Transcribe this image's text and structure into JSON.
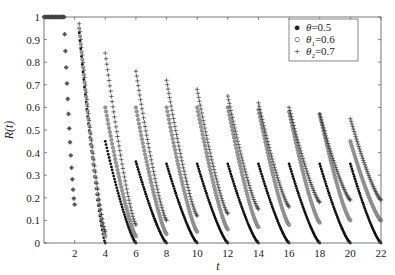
{
  "chart_data": {
    "type": "scatter",
    "title": "",
    "xlabel": "t",
    "ylabel": "R(t)",
    "xlim": [
      0,
      22
    ],
    "ylim": [
      0,
      1
    ],
    "xticks": [
      2,
      4,
      6,
      8,
      10,
      12,
      14,
      16,
      18,
      20,
      22
    ],
    "yticks": [
      0,
      0.1,
      0.2,
      0.3,
      0.4,
      0.5,
      0.6,
      0.7,
      0.8,
      0.9,
      1
    ],
    "grid": false,
    "legend_position": "upper right",
    "series": [
      {
        "name": "θ=0.5",
        "marker": "dot",
        "segments": [
          {
            "t0": 0,
            "t1": 1.3,
            "r0": 1.0,
            "r1": 1.0
          },
          {
            "t0": 1.3,
            "t1": 2.0,
            "r0": 1.0,
            "r1": 0.17
          },
          {
            "t0": 2.3,
            "t1": 4.0,
            "r0": 0.93,
            "r1": 0.0
          },
          {
            "t0": 4.0,
            "t1": 6.0,
            "r0": 0.45,
            "r1": 0.0
          },
          {
            "t0": 6.0,
            "t1": 8.0,
            "r0": 0.36,
            "r1": 0.0
          },
          {
            "t0": 8.0,
            "t1": 10.0,
            "r0": 0.35,
            "r1": 0.0
          },
          {
            "t0": 10.0,
            "t1": 12.0,
            "r0": 0.35,
            "r1": 0.0
          },
          {
            "t0": 12.0,
            "t1": 14.0,
            "r0": 0.35,
            "r1": 0.0
          },
          {
            "t0": 14.0,
            "t1": 16.0,
            "r0": 0.35,
            "r1": 0.0
          },
          {
            "t0": 16.0,
            "t1": 18.0,
            "r0": 0.35,
            "r1": 0.0
          },
          {
            "t0": 18.0,
            "t1": 20.0,
            "r0": 0.35,
            "r1": 0.0
          },
          {
            "t0": 20.0,
            "t1": 22.0,
            "r0": 0.35,
            "r1": 0.0
          }
        ]
      },
      {
        "name": "θ1=0.6",
        "marker": "circle",
        "segments": [
          {
            "t0": 0,
            "t1": 1.3,
            "r0": 1.0,
            "r1": 1.0
          },
          {
            "t0": 1.3,
            "t1": 2.0,
            "r0": 1.0,
            "r1": 0.17
          },
          {
            "t0": 2.3,
            "t1": 4.0,
            "r0": 0.95,
            "r1": 0.03
          },
          {
            "t0": 4.0,
            "t1": 6.0,
            "r0": 0.6,
            "r1": 0.03
          },
          {
            "t0": 6.0,
            "t1": 8.0,
            "r0": 0.6,
            "r1": 0.04
          },
          {
            "t0": 8.0,
            "t1": 10.0,
            "r0": 0.6,
            "r1": 0.05
          },
          {
            "t0": 10.0,
            "t1": 12.0,
            "r0": 0.6,
            "r1": 0.06
          },
          {
            "t0": 12.0,
            "t1": 14.0,
            "r0": 0.6,
            "r1": 0.07
          },
          {
            "t0": 14.0,
            "t1": 16.0,
            "r0": 0.59,
            "r1": 0.08
          },
          {
            "t0": 16.0,
            "t1": 18.0,
            "r0": 0.58,
            "r1": 0.09
          },
          {
            "t0": 18.0,
            "t1": 20.0,
            "r0": 0.57,
            "r1": 0.1
          },
          {
            "t0": 20.0,
            "t1": 22.0,
            "r0": 0.45,
            "r1": 0.1
          }
        ]
      },
      {
        "name": "θ2=0.7",
        "marker": "plus",
        "segments": [
          {
            "t0": 0,
            "t1": 1.3,
            "r0": 1.0,
            "r1": 1.0
          },
          {
            "t0": 1.3,
            "t1": 2.0,
            "r0": 1.0,
            "r1": 0.17
          },
          {
            "t0": 2.3,
            "t1": 4.0,
            "r0": 0.97,
            "r1": 0.05
          },
          {
            "t0": 4.0,
            "t1": 6.0,
            "r0": 0.84,
            "r1": 0.08
          },
          {
            "t0": 6.0,
            "t1": 8.0,
            "r0": 0.76,
            "r1": 0.1
          },
          {
            "t0": 8.0,
            "t1": 10.0,
            "r0": 0.72,
            "r1": 0.12
          },
          {
            "t0": 10.0,
            "t1": 12.0,
            "r0": 0.68,
            "r1": 0.13
          },
          {
            "t0": 12.0,
            "t1": 14.0,
            "r0": 0.65,
            "r1": 0.15
          },
          {
            "t0": 14.0,
            "t1": 16.0,
            "r0": 0.62,
            "r1": 0.16
          },
          {
            "t0": 16.0,
            "t1": 18.0,
            "r0": 0.6,
            "r1": 0.18
          },
          {
            "t0": 18.0,
            "t1": 20.0,
            "r0": 0.57,
            "r1": 0.19
          },
          {
            "t0": 20.0,
            "t1": 22.0,
            "r0": 0.55,
            "r1": 0.19
          }
        ]
      }
    ]
  },
  "legend": {
    "items": [
      {
        "symbol": "●",
        "label": "θ",
        "sub": "",
        "value": "=0.5"
      },
      {
        "symbol": "○",
        "label": "θ",
        "sub": "1",
        "value": "=0.6"
      },
      {
        "symbol": "+",
        "label": "θ",
        "sub": "2",
        "value": "=0.7"
      }
    ]
  },
  "colors": {
    "dot": "#111111",
    "circle": "#777777",
    "plus": "#333333",
    "axis": "#444444"
  }
}
